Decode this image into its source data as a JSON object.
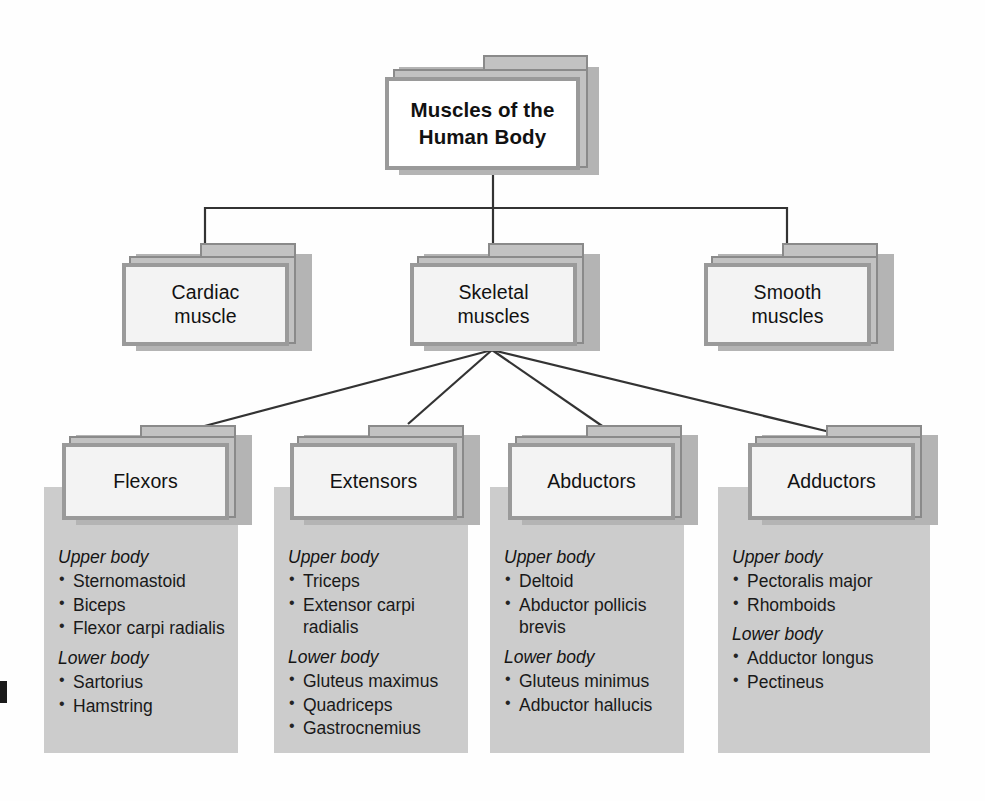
{
  "diagram": {
    "title": "Muscles of the Human Body",
    "type": "hierarchy-folder-chart",
    "colors": {
      "folder_back": "#c2c2c2",
      "folder_border": "#8a8a8a",
      "folder_front_border": "#9a9a9a",
      "panel_gray": "#cccccc",
      "shadow": "#b4b4b4",
      "text": "#111111",
      "line": "#333333"
    }
  },
  "root": {
    "label_line1": "Muscles of the",
    "label_line2": "Human Body"
  },
  "level2": [
    {
      "label_line1": "Cardiac",
      "label_line2": "muscle"
    },
    {
      "label_line1": "Skeletal",
      "label_line2": "muscles"
    },
    {
      "label_line1": "Smooth",
      "label_line2": "muscles"
    }
  ],
  "level3": [
    {
      "label": "Flexors",
      "groups": [
        {
          "heading": "Upper body",
          "items": [
            "Sternomastoid",
            "Biceps",
            "Flexor carpi radialis"
          ]
        },
        {
          "heading": "Lower body",
          "items": [
            "Sartorius",
            "Hamstring"
          ]
        }
      ]
    },
    {
      "label": "Extensors",
      "groups": [
        {
          "heading": "Upper body",
          "items": [
            "Triceps",
            "Extensor carpi radialis"
          ]
        },
        {
          "heading": "Lower body",
          "items": [
            "Gluteus maximus",
            "Quadriceps",
            "Gastrocnemius"
          ]
        }
      ]
    },
    {
      "label": "Abductors",
      "groups": [
        {
          "heading": "Upper body",
          "items": [
            "Deltoid",
            "Abductor pollicis brevis"
          ]
        },
        {
          "heading": "Lower body",
          "items": [
            "Gluteus minimus",
            "Adbuctor hallucis"
          ]
        }
      ]
    },
    {
      "label": "Adductors",
      "groups": [
        {
          "heading": "Upper body",
          "items": [
            "Pectoralis major",
            "Rhomboids"
          ]
        },
        {
          "heading": "Lower body",
          "items": [
            "Adductor longus",
            "Pectineus"
          ]
        }
      ]
    }
  ],
  "bullet": "•"
}
